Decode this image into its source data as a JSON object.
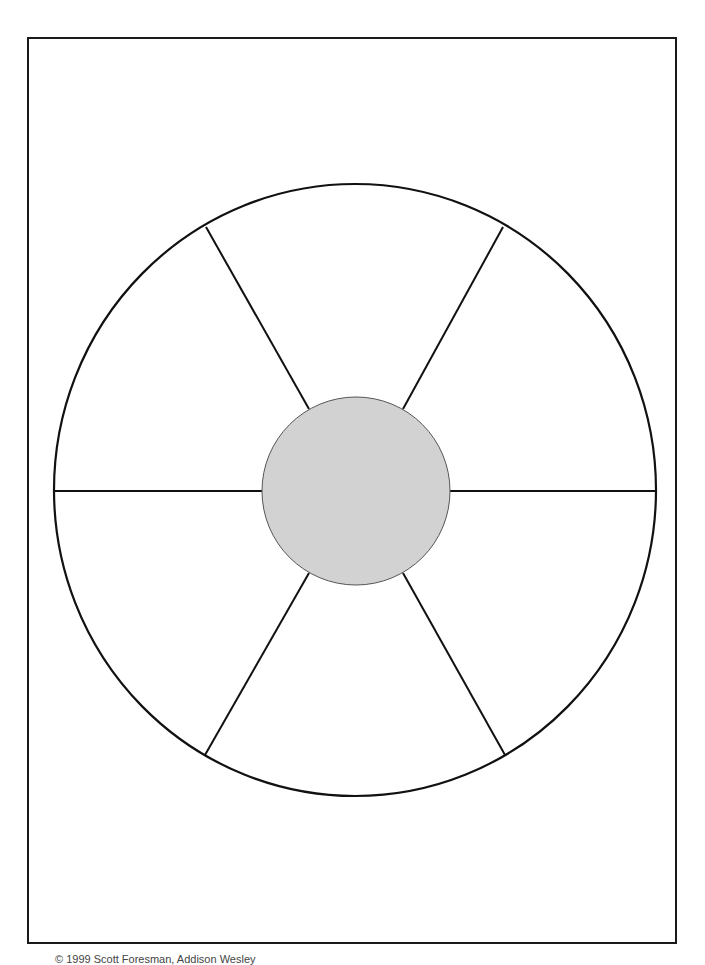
{
  "diagram": {
    "type": "wheel-graphic-organizer",
    "outer_circle": {
      "cx": 355,
      "cy": 490,
      "rx": 301,
      "ry": 306,
      "stroke": "#111111"
    },
    "hub": {
      "cx": 356,
      "cy": 491,
      "r": 94,
      "fill": "#d2d2d2",
      "stroke": "#555555"
    },
    "segments": 6,
    "spokes": [
      {
        "x1": 54,
        "y1": 491,
        "x2": 262,
        "y2": 491
      },
      {
        "x1": 450,
        "y1": 491,
        "x2": 655,
        "y2": 491
      },
      {
        "x1": 206,
        "y1": 227,
        "x2": 309,
        "y2": 409
      },
      {
        "x1": 503,
        "y1": 227,
        "x2": 403,
        "y2": 409
      },
      {
        "x1": 205,
        "y1": 755,
        "x2": 309,
        "y2": 573
      },
      {
        "x1": 505,
        "y1": 755,
        "x2": 403,
        "y2": 573
      }
    ],
    "segment_labels": [
      "",
      "",
      "",
      "",
      "",
      ""
    ],
    "hub_label": ""
  },
  "footer": {
    "text": "© 1999 Scott Foresman, Addison Wesley"
  },
  "colors": {
    "line": "#111111",
    "hub_fill": "#d2d2d2",
    "background": "#ffffff"
  }
}
